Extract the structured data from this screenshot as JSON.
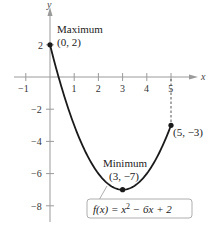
{
  "chart_data": {
    "type": "line",
    "title": "",
    "function": "f(x) = x^2 - 6x + 2",
    "xlabel": "x",
    "ylabel": "y",
    "xlim": [
      -1.3,
      6
    ],
    "ylim": [
      -9,
      3.5
    ],
    "x_ticks": [
      -1,
      1,
      2,
      3,
      4,
      5
    ],
    "x_tick_labels": [
      "−1",
      "1",
      "2",
      "3",
      "4",
      "5"
    ],
    "y_ticks": [
      2,
      -2,
      -4,
      -6,
      -8
    ],
    "y_tick_labels": [
      "2",
      "−2",
      "−4",
      "−6",
      "−8"
    ],
    "grid": false,
    "series": [
      {
        "name": "f(x) = x² − 6x + 2",
        "x": [
          0,
          0.5,
          1,
          1.5,
          2,
          2.5,
          3,
          3.5,
          4,
          4.5,
          5
        ],
        "values": [
          2,
          -0.75,
          -3,
          -4.75,
          -6,
          -6.75,
          -7,
          -6.75,
          -6,
          -4.75,
          -3
        ]
      }
    ],
    "points": [
      {
        "x": 0,
        "y": 2,
        "label": "Maximum",
        "coord_label": "(0, 2)"
      },
      {
        "x": 3,
        "y": -7,
        "label": "Minimum",
        "coord_label": "(3, −7)"
      },
      {
        "x": 5,
        "y": -3,
        "label": "",
        "coord_label": "(5, −3)"
      }
    ],
    "annotations": [
      "Maximum (0, 2)",
      "Minimum (3, −7)",
      "(5, −3)",
      "f(x) = x² − 6x + 2"
    ],
    "dashed_line": {
      "x": 5,
      "from_y": 0,
      "to_y": -3
    }
  },
  "labels": {
    "x_axis": "x",
    "y_axis": "y",
    "max_title": "Maximum",
    "max_coord": "(0, 2)",
    "min_title": "Minimum",
    "min_coord": "(3, −7)",
    "end_coord": "(5, −3)",
    "formula_prefix": "f(x) = x",
    "formula_exp": "2",
    "formula_suffix": " − 6x + 2"
  },
  "ticks": {
    "x": [
      "−1",
      "1",
      "2",
      "3",
      "4",
      "5"
    ],
    "y": [
      "2",
      "−2",
      "−4",
      "−6",
      "−8"
    ]
  },
  "colors": {
    "curve": "#1a1a1a",
    "axis": "#9a9a9a",
    "callout_border": "#999999"
  }
}
